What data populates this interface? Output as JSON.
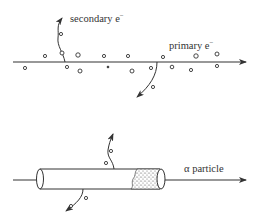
{
  "top_diagram": {
    "secondary_label": "secondary e",
    "secondary_sup": "−",
    "primary_label": "primary e",
    "primary_sup": "−"
  },
  "bottom_diagram": {
    "alpha_label": "α particle"
  },
  "colors": {
    "ink": "#333333",
    "background": "#ffffff"
  }
}
